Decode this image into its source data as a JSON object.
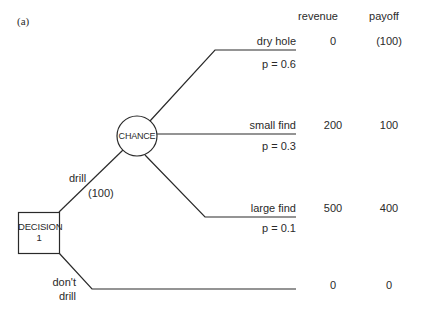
{
  "figure_label": "(a)",
  "columns": {
    "revenue": "revenue",
    "payoff": "payoff"
  },
  "decision_node": {
    "line1": "DECISION",
    "line2": "1"
  },
  "chance_node": {
    "label": "CHANCE"
  },
  "branches": {
    "drill": {
      "label": "drill",
      "cost": "(100)"
    },
    "dont_drill": {
      "line1": "don't",
      "line2": "drill",
      "revenue": "0",
      "payoff": "0"
    }
  },
  "outcomes": [
    {
      "label": "dry hole",
      "prob": "p = 0.6",
      "revenue": "0",
      "payoff": "(100)"
    },
    {
      "label": "small find",
      "prob": "p = 0.3",
      "revenue": "200",
      "payoff": "100"
    },
    {
      "label": "large find",
      "prob": "p = 0.1",
      "revenue": "500",
      "payoff": "400"
    }
  ]
}
